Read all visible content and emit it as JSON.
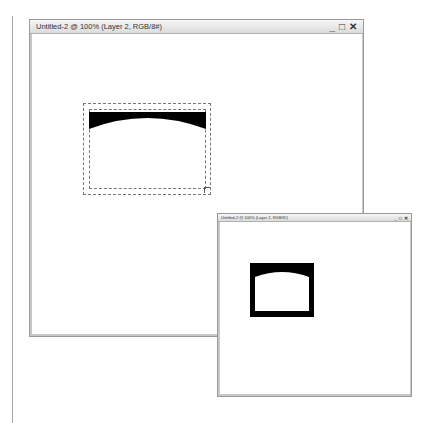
{
  "windows": [
    {
      "title": "Untitled-2 @ 100% (Layer 2, RGB/8#)",
      "controls": {
        "minimize": "_",
        "maximize": "□",
        "close": "✕"
      },
      "canvas": {
        "shape": "arched-frame-top-band",
        "fill": "#000000",
        "selection": "marching-ants"
      }
    },
    {
      "title": "Untitled-2 @ 100% (Layer 2, RGB/8#)",
      "controls": {
        "minimize": "_",
        "maximize": "□",
        "close": "✕"
      },
      "canvas": {
        "shape": "arched-frame-outline",
        "fill": "#000000"
      }
    }
  ]
}
